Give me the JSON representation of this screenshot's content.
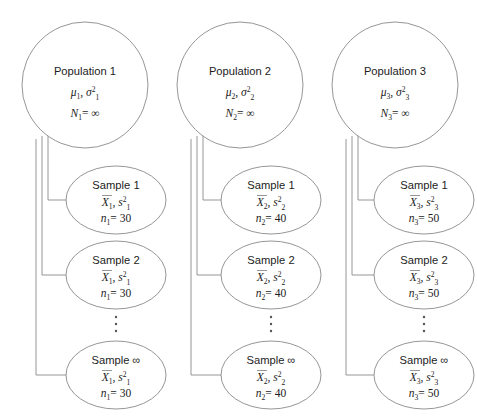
{
  "figure": {
    "kind": "sampling-distribution-diagram",
    "background_color": "#ffffff",
    "stroke_color": "#8a8a8a",
    "text_color": "#1c1c1c"
  },
  "columns": [
    {
      "population": {
        "title": "Population 1",
        "params": "μ₁, σ₁²",
        "param_mu": "μ",
        "param_mu_sub": "1",
        "param_sigma": "σ",
        "param_sigma_sub": "1",
        "param_sigma_sup": "2",
        "size_symbol": "N",
        "size_sub": "1",
        "size_value": "= ∞",
        "size_line": "N₁ = ∞"
      },
      "samples": [
        {
          "title": "Sample 1",
          "label": "Sample",
          "index": "1",
          "stat_mean": "X",
          "stat_mean_sub": "1",
          "stat_var": "s",
          "stat_var_sub": "1",
          "stat_var_sup": "2",
          "stats_line": "X̄1, s₁²",
          "n_symbol": "n",
          "n_sub": "1",
          "n_value": "= 30",
          "n_line": "n₁ = 30"
        },
        {
          "title": "Sample 2",
          "label": "Sample",
          "index": "2",
          "stat_mean": "X",
          "stat_mean_sub": "1",
          "stat_var": "s",
          "stat_var_sub": "1",
          "stat_var_sup": "2",
          "stats_line": "X̄1, s₁²",
          "n_symbol": "n",
          "n_sub": "1",
          "n_value": "= 30",
          "n_line": "n₁ = 30"
        },
        {
          "title": "Sample ∞",
          "label": "Sample",
          "index": "∞",
          "stat_mean": "X",
          "stat_mean_sub": "1",
          "stat_var": "s",
          "stat_var_sub": "1",
          "stat_var_sup": "2",
          "stats_line": "X̄1, s₁²",
          "n_symbol": "n",
          "n_sub": "1",
          "n_value": "= 30",
          "n_line": "n₁ = 30"
        }
      ]
    },
    {
      "population": {
        "title": "Population 2",
        "params": "μ₂, σ₂²",
        "param_mu": "μ",
        "param_mu_sub": "2",
        "param_sigma": "σ",
        "param_sigma_sub": "2",
        "param_sigma_sup": "2",
        "size_symbol": "N",
        "size_sub": "2",
        "size_value": "= ∞",
        "size_line": "N₂ = ∞"
      },
      "samples": [
        {
          "title": "Sample 1",
          "label": "Sample",
          "index": "1",
          "stat_mean": "X",
          "stat_mean_sub": "2",
          "stat_var": "s",
          "stat_var_sub": "2",
          "stat_var_sup": "2",
          "stats_line": "X̄2, s₂²",
          "n_symbol": "n",
          "n_sub": "2",
          "n_value": "= 40",
          "n_line": "n₂ = 40"
        },
        {
          "title": "Sample 2",
          "label": "Sample",
          "index": "2",
          "stat_mean": "X",
          "stat_mean_sub": "2",
          "stat_var": "s",
          "stat_var_sub": "2",
          "stat_var_sup": "2",
          "stats_line": "X̄2, s₂²",
          "n_symbol": "n",
          "n_sub": "2",
          "n_value": "= 40",
          "n_line": "n₂ = 40"
        },
        {
          "title": "Sample ∞",
          "label": "Sample",
          "index": "∞",
          "stat_mean": "X",
          "stat_mean_sub": "2",
          "stat_var": "s",
          "stat_var_sub": "2",
          "stat_var_sup": "2",
          "stats_line": "X̄2, s₂²",
          "n_symbol": "n",
          "n_sub": "2",
          "n_value": "= 40",
          "n_line": "n₂ = 40"
        }
      ]
    },
    {
      "population": {
        "title": "Population 3",
        "params": "μ₃, σ₃²",
        "param_mu": "μ",
        "param_mu_sub": "3",
        "param_sigma": "σ",
        "param_sigma_sub": "3",
        "param_sigma_sup": "2",
        "size_symbol": "N",
        "size_sub": "3",
        "size_value": "= ∞",
        "size_line": "N₃ = ∞"
      },
      "samples": [
        {
          "title": "Sample 1",
          "label": "Sample",
          "index": "1",
          "stat_mean": "X",
          "stat_mean_sub": "3",
          "stat_var": "s",
          "stat_var_sub": "3",
          "stat_var_sup": "2",
          "stats_line": "X̄3, s₃²",
          "n_symbol": "n",
          "n_sub": "3",
          "n_value": "= 50",
          "n_line": "n₃ = 50"
        },
        {
          "title": "Sample 2",
          "label": "Sample",
          "index": "2",
          "stat_mean": "X",
          "stat_mean_sub": "3",
          "stat_var": "s",
          "stat_var_sub": "3",
          "stat_var_sup": "2",
          "stats_line": "X̄3, s₃²",
          "n_symbol": "n",
          "n_sub": "3",
          "n_value": "= 50",
          "n_line": "n₃ = 50"
        },
        {
          "title": "Sample ∞",
          "label": "Sample",
          "index": "∞",
          "stat_mean": "X",
          "stat_mean_sub": "3",
          "stat_var": "s",
          "stat_var_sub": "3",
          "stat_var_sup": "2",
          "stats_line": "X̄3, s₃²",
          "n_symbol": "n",
          "n_sub": "3",
          "n_value": "= 50",
          "n_line": "n₃ = 50"
        }
      ]
    }
  ],
  "ellipsis_symbol": "⋮"
}
